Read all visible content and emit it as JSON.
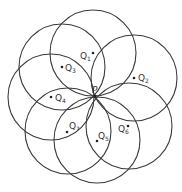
{
  "diagram": {
    "center_point": {
      "label": "P",
      "x": 95,
      "y": 96
    },
    "radius": 43,
    "stroke_color": "#3a3a3a",
    "circles": [
      {
        "name": "Q",
        "sub": "1",
        "cx": 93,
        "cy": 53,
        "label_x": 80,
        "label_y": 59,
        "dot_x": 93,
        "dot_y": 53
      },
      {
        "name": "Q",
        "sub": "2",
        "cx": 134,
        "cy": 78,
        "label_x": 138,
        "label_y": 81,
        "dot_x": 134,
        "dot_y": 78
      },
      {
        "name": "Q",
        "sub": "3",
        "cx": 62,
        "cy": 67,
        "label_x": 65,
        "label_y": 71,
        "dot_x": 62,
        "dot_y": 67
      },
      {
        "name": "Q",
        "sub": "4",
        "cx": 51,
        "cy": 97,
        "label_x": 55,
        "label_y": 101,
        "dot_x": 51,
        "dot_y": 97
      },
      {
        "name": "Q",
        "sub": "5",
        "cx": 97,
        "cy": 140,
        "label_x": 98,
        "label_y": 139,
        "dot_x": 97,
        "dot_y": 141
      },
      {
        "name": "Q",
        "sub": "6",
        "cx": 129,
        "cy": 126,
        "label_x": 118,
        "label_y": 132,
        "dot_x": 128,
        "dot_y": 126
      },
      {
        "name": "Q",
        "sub": "7",
        "cx": 68,
        "cy": 131,
        "label_x": 69,
        "label_y": 129,
        "dot_x": 67,
        "dot_y": 132
      }
    ]
  }
}
